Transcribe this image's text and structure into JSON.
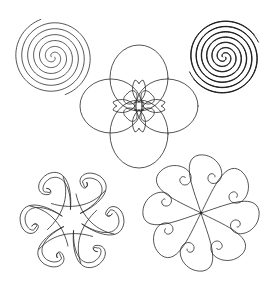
{
  "canvas": {
    "width": 271,
    "height": 292,
    "background": "#ffffff",
    "stroke": "#2a2a2a"
  },
  "motifs": [
    {
      "id": "spiral-single",
      "type": "spiral",
      "center": [
        53,
        57
      ],
      "radius": 38,
      "arms": 2,
      "turns": 3.2
    },
    {
      "id": "spiral-double",
      "type": "spiral",
      "center": [
        224,
        57
      ],
      "radius": 36,
      "arms": 2,
      "doubled": true,
      "turns": 3.4
    },
    {
      "id": "four-petal-flower",
      "type": "flower",
      "center": [
        139,
        106
      ],
      "petals": 4,
      "outer_radius": 46,
      "inner_petals": 4
    },
    {
      "id": "six-lobe-knot",
      "type": "knot",
      "center": [
        72,
        220
      ],
      "radius": 52,
      "lobes": 6
    },
    {
      "id": "eight-lobe-swirl",
      "type": "swirl",
      "center": [
        201,
        213
      ],
      "radius": 58,
      "lobes": 8
    }
  ]
}
